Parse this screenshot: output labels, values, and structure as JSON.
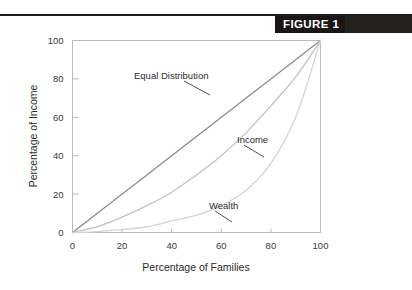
{
  "figure": {
    "badge_label": "FIGURE 1"
  },
  "chart_data": {
    "type": "line",
    "title": "",
    "xlabel": "Percentage of Families",
    "ylabel": "Percentage of Income",
    "xlim": [
      0,
      100
    ],
    "ylim": [
      0,
      100
    ],
    "xticks": [
      "0",
      "20",
      "40",
      "60",
      "80",
      "100"
    ],
    "yticks": [
      "0",
      "20",
      "40",
      "60",
      "80",
      "100"
    ],
    "xtick_values": [
      0,
      20,
      40,
      60,
      80,
      100
    ],
    "ytick_values": [
      0,
      20,
      40,
      60,
      80,
      100
    ],
    "grid": false,
    "legend": "none",
    "annotations": [
      {
        "text": "Equal Distribution",
        "x": 30,
        "y": 80
      },
      {
        "text": "Income",
        "x": 66,
        "y": 47
      },
      {
        "text": "Wealth",
        "x": 52,
        "y": 17
      }
    ],
    "series": [
      {
        "name": "Equal Distribution",
        "color": "#8c8c8c",
        "x": [
          0,
          10,
          20,
          30,
          40,
          50,
          60,
          70,
          80,
          90,
          100
        ],
        "values": [
          0,
          10,
          20,
          30,
          40,
          50,
          60,
          70,
          80,
          90,
          100
        ]
      },
      {
        "name": "Income",
        "color": "#c2c2c2",
        "x": [
          0,
          10,
          20,
          30,
          40,
          50,
          60,
          70,
          80,
          90,
          100
        ],
        "values": [
          0,
          3,
          8,
          14,
          21,
          30,
          40,
          52,
          66,
          81,
          100
        ]
      },
      {
        "name": "Wealth",
        "color": "#d4d4d4",
        "x": [
          0,
          10,
          20,
          30,
          40,
          50,
          60,
          70,
          80,
          90,
          100
        ],
        "values": [
          0,
          0.5,
          1.5,
          3,
          6,
          9,
          14,
          22,
          36,
          60,
          100
        ]
      }
    ]
  },
  "colors": {
    "frame": "#b9b9b9",
    "text": "#2b2b2b",
    "badge_background": "#191615",
    "badge_text": "#ffffff"
  }
}
